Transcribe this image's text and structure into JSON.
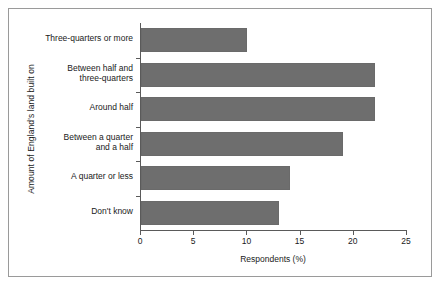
{
  "chart_data": {
    "type": "bar",
    "orientation": "horizontal",
    "title": "",
    "xlabel": "Respondents (%)",
    "ylabel": "Amount of England's land built on",
    "categories": [
      "Three-quarters or more",
      "Between half and three-quarters",
      "Around half",
      "Between a quarter and a half",
      "A quarter or less",
      "Don't know"
    ],
    "category_lines": [
      [
        "Three-quarters or more"
      ],
      [
        "Between half and",
        "three-quarters"
      ],
      [
        "Around half"
      ],
      [
        "Between a quarter",
        "and a half"
      ],
      [
        "A quarter or less"
      ],
      [
        "Don't know"
      ]
    ],
    "values": [
      10,
      22,
      22,
      19,
      14,
      13
    ],
    "xlim": [
      0,
      25
    ],
    "xticks": [
      0,
      5,
      10,
      15,
      20,
      25
    ],
    "xtick_labels": [
      "0",
      "5",
      "10",
      "15",
      "20",
      "25"
    ],
    "grid": false,
    "legend": false,
    "bar_color": "#6e6e6e",
    "axis_color": "#5a5a5a",
    "frame_color": "#9a9a9a",
    "background": "#ffffff"
  }
}
